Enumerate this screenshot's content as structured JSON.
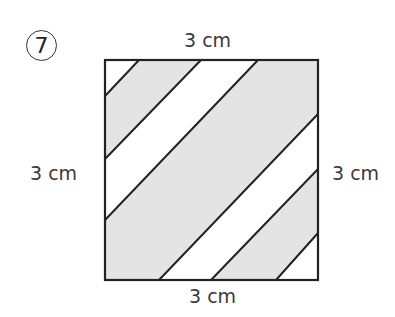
{
  "problem": {
    "number": "7",
    "number_style": "circled"
  },
  "labels": {
    "top": "3 cm",
    "left": "3 cm",
    "right": "3 cm",
    "bottom": "3 cm"
  },
  "figure": {
    "shape": "square",
    "side_length": "3 cm",
    "square_px": {
      "x0": 105,
      "y0": 60,
      "x1": 318,
      "y1": 280
    },
    "stripe_count": 7,
    "stripe_fills": [
      "white",
      "gray",
      "white",
      "gray",
      "white",
      "gray",
      "white"
    ],
    "colors": {
      "shade": "#e4e4e4",
      "stroke": "#222222",
      "background": "#ffffff"
    }
  }
}
